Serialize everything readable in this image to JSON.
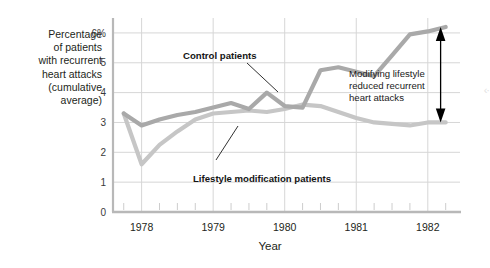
{
  "axis": {
    "y_title_lines": [
      "Percentage",
      "of patients",
      "with recurrent",
      "heart attacks",
      "(cumulative",
      "average)"
    ],
    "y_ticks": [
      "6%",
      "5",
      "4",
      "3",
      "2",
      "1",
      "0"
    ],
    "x_title": "Year",
    "x_ticks": [
      "1978",
      "1979",
      "1980",
      "1981",
      "1982"
    ]
  },
  "labels": {
    "control": "Control patients",
    "lifestyle": "Lifestyle modification patients",
    "annotation_lines": [
      "Modifying lifestyle",
      "reduced recurrent",
      "heart attacks"
    ]
  },
  "colors": {
    "control_line": "#a9a9a9",
    "lifestyle_line": "#c6c6c6",
    "grid": "#d6d6d6",
    "axis": "#b8b8b8",
    "text": "#231f20",
    "arrow": "#000000"
  },
  "icons": {
    "gap_arrow": "double-headed-vertical-arrow-icon",
    "control_leader": "leader-line-icon",
    "lifestyle_leader": "leader-line-icon"
  },
  "chart_data": {
    "type": "line",
    "title": "",
    "xlabel": "Year",
    "ylabel": "Percentage of patients with recurrent heart attacks (cumulative average)",
    "xlim": [
      1977.6,
      1982.45
    ],
    "ylim": [
      0,
      6.5
    ],
    "grid": true,
    "legend": "inline-labels",
    "y_tick_values": [
      0,
      1,
      2,
      3,
      4,
      5,
      6
    ],
    "x_tick_values": [
      1978,
      1979,
      1980,
      1981,
      1982
    ],
    "x_minor_tick_interval": 0.25,
    "x": [
      1977.75,
      1978.0,
      1978.25,
      1978.5,
      1978.75,
      1979.0,
      1979.25,
      1979.5,
      1979.75,
      1980.0,
      1980.25,
      1980.5,
      1980.75,
      1981.0,
      1981.25,
      1981.5,
      1981.75,
      1982.0,
      1982.25
    ],
    "series": [
      {
        "name": "Control patients",
        "color": "#a9a9a9",
        "values": [
          3.3,
          2.9,
          3.1,
          3.25,
          3.35,
          3.5,
          3.65,
          3.45,
          4.0,
          3.55,
          3.5,
          4.75,
          4.85,
          4.7,
          4.55,
          5.25,
          5.95,
          6.05,
          6.2
        ]
      },
      {
        "name": "Lifestyle modification patients",
        "color": "#c6c6c6",
        "values": [
          3.3,
          1.6,
          2.25,
          2.7,
          3.1,
          3.3,
          3.35,
          3.4,
          3.35,
          3.45,
          3.6,
          3.55,
          3.35,
          3.15,
          3.0,
          2.95,
          2.9,
          3.0,
          3.0
        ]
      }
    ],
    "annotations": [
      {
        "text": "Modifying lifestyle reduced recurrent heart attacks",
        "x": 1981.55,
        "y": 4.4
      },
      {
        "text": "Control patients",
        "x": 1979.1,
        "y": 5.55
      },
      {
        "text": "Lifestyle modification patients",
        "x": 1979.45,
        "y": 1.55
      }
    ],
    "gap_marker": {
      "x": 1982.2,
      "y_top": 6.2,
      "y_bottom": 3.0
    }
  }
}
